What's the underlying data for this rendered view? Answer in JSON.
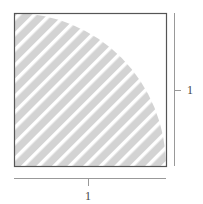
{
  "diagram": {
    "square": {
      "side_label": "1",
      "border_color": "#555555"
    },
    "quarter_circle": {
      "fill_color": "#d3d3d3",
      "stripe_color": "#ffffff",
      "hatch": "diagonal"
    },
    "dimensions": {
      "horizontal": {
        "label": "1"
      },
      "vertical": {
        "label": "1"
      }
    }
  }
}
